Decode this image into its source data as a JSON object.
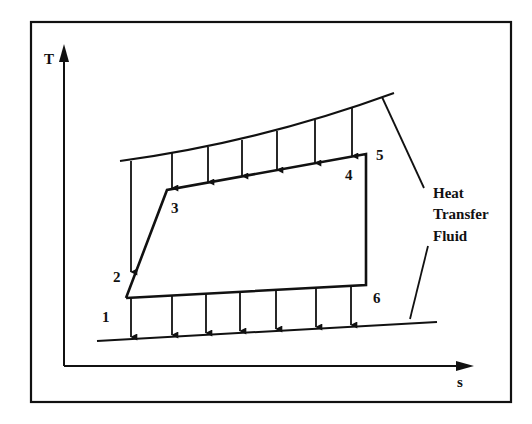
{
  "figure": {
    "type": "T-s diagram",
    "axes": {
      "y_label": "T",
      "x_label": "s"
    },
    "state_points": [
      {
        "id": "1",
        "label": "1"
      },
      {
        "id": "2",
        "label": "2"
      },
      {
        "id": "3",
        "label": "3"
      },
      {
        "id": "4",
        "label": "4"
      },
      {
        "id": "5",
        "label": "5"
      },
      {
        "id": "6",
        "label": "6"
      }
    ],
    "annotation": {
      "lines": [
        "Heat",
        "Transfer",
        "Fluid"
      ]
    },
    "colors": {
      "ink": "#111111",
      "background": "#ffffff"
    }
  }
}
